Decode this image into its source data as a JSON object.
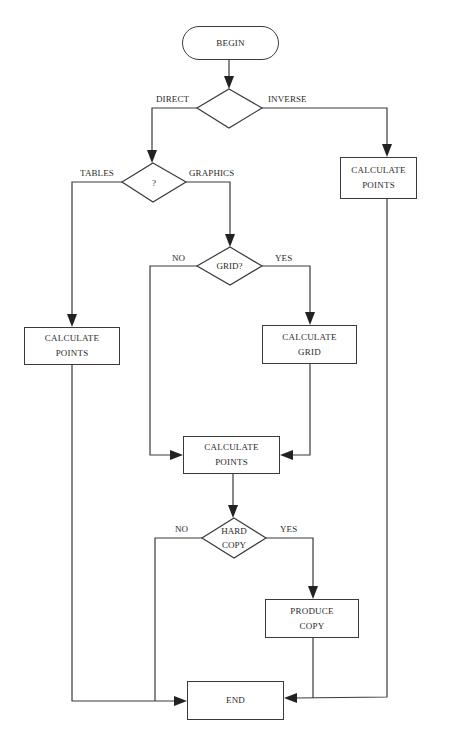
{
  "diagram": {
    "type": "flowchart",
    "nodes": {
      "begin": {
        "label": "BEGIN",
        "shape": "terminal"
      },
      "direction_decision": {
        "label": "",
        "shape": "diamond"
      },
      "output_decision": {
        "label": "?",
        "shape": "diamond"
      },
      "calc_points_inverse": {
        "line1": "CALCULATE",
        "line2": "POINTS",
        "shape": "box"
      },
      "calc_points_tables": {
        "line1": "CALCULATE",
        "line2": "POINTS",
        "shape": "box"
      },
      "grid_decision": {
        "label": "GRID?",
        "shape": "diamond"
      },
      "calc_grid": {
        "line1": "CALCULATE",
        "line2": "GRID",
        "shape": "box"
      },
      "calc_points_graphics": {
        "line1": "CALCULATE",
        "line2": "POINTS",
        "shape": "box"
      },
      "hardcopy_decision": {
        "line1": "HARD",
        "line2": "COPY",
        "shape": "diamond"
      },
      "produce_copy": {
        "line1": "PRODUCE",
        "line2": "COPY",
        "shape": "box"
      },
      "end": {
        "label": "END",
        "shape": "box"
      }
    },
    "edge_labels": {
      "direct": "DIRECT",
      "inverse": "INVERSE",
      "tables": "TABLES",
      "graphics": "GRAPHICS",
      "grid_no": "NO",
      "grid_yes": "YES",
      "hardcopy_no": "NO",
      "hardcopy_yes": "YES"
    },
    "edges": [
      {
        "from": "begin",
        "to": "direction_decision"
      },
      {
        "from": "direction_decision",
        "to": "output_decision",
        "label": "DIRECT"
      },
      {
        "from": "direction_decision",
        "to": "calc_points_inverse",
        "label": "INVERSE"
      },
      {
        "from": "output_decision",
        "to": "calc_points_tables",
        "label": "TABLES"
      },
      {
        "from": "output_decision",
        "to": "grid_decision",
        "label": "GRAPHICS"
      },
      {
        "from": "grid_decision",
        "to": "calc_points_graphics",
        "label": "NO"
      },
      {
        "from": "grid_decision",
        "to": "calc_grid",
        "label": "YES"
      },
      {
        "from": "calc_grid",
        "to": "calc_points_graphics"
      },
      {
        "from": "calc_points_graphics",
        "to": "hardcopy_decision"
      },
      {
        "from": "hardcopy_decision",
        "to": "end",
        "label": "NO"
      },
      {
        "from": "hardcopy_decision",
        "to": "produce_copy",
        "label": "YES"
      },
      {
        "from": "produce_copy",
        "to": "end"
      },
      {
        "from": "calc_points_tables",
        "to": "end"
      },
      {
        "from": "calc_points_inverse",
        "to": "end"
      }
    ]
  }
}
